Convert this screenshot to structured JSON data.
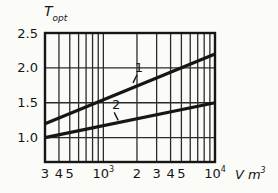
{
  "page": {
    "background": "#fbfbf8",
    "ink_color": "#161616"
  },
  "chart_data": {
    "type": "line",
    "title": "",
    "x_axis": {
      "scale": "log",
      "xlim": [
        300,
        10000
      ],
      "unit_label": {
        "symbol": "V",
        "unit": "m",
        "exponent": "3"
      },
      "major_ticks": [
        {
          "value": 300,
          "base": "3",
          "exponent": ""
        },
        {
          "value": 400,
          "base": "4",
          "exponent": ""
        },
        {
          "value": 500,
          "base": "5",
          "exponent": ""
        },
        {
          "value": 1000,
          "base": "10",
          "exponent": "3"
        },
        {
          "value": 2000,
          "base": "2",
          "exponent": ""
        },
        {
          "value": 3000,
          "base": "3",
          "exponent": ""
        },
        {
          "value": 4000,
          "base": "4",
          "exponent": ""
        },
        {
          "value": 5000,
          "base": "5",
          "exponent": ""
        },
        {
          "value": 10000,
          "base": "10",
          "exponent": "4"
        }
      ],
      "minor_ticks": [
        600,
        700,
        800,
        900,
        6000,
        7000,
        8000,
        9000
      ]
    },
    "y_axis": {
      "scale": "linear",
      "ylim": [
        0.65,
        2.5
      ],
      "title": {
        "symbol": "T",
        "subscript": "opt"
      },
      "ticks": [
        {
          "value": 1.0,
          "label": "1.0"
        },
        {
          "value": 1.5,
          "label": "1.5"
        },
        {
          "value": 2.0,
          "label": "2.0"
        },
        {
          "value": 2.5,
          "label": "2.5"
        }
      ]
    },
    "grid": true,
    "legend": "inline-curve-numbers",
    "series": [
      {
        "name": "1",
        "label": "1",
        "points": [
          [
            300,
            1.2
          ],
          [
            10000,
            2.2
          ]
        ],
        "label_at_x": 2000
      },
      {
        "name": "2",
        "label": "2",
        "points": [
          [
            300,
            1.0
          ],
          [
            10000,
            1.5
          ]
        ],
        "label_at_x": 1250
      }
    ],
    "colors": {
      "series_line": "#161616",
      "grid_line": "#2b2b2b",
      "border": "#161616",
      "text": "#161616"
    }
  }
}
